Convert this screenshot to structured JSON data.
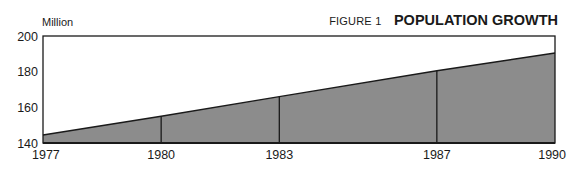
{
  "header": {
    "unit_label": "Million",
    "figure_label": "FIGURE 1",
    "title": "POPULATION GROWTH"
  },
  "colors": {
    "fill": "#8c8c8c",
    "line": "#1a1a1a",
    "background": "#ffffff"
  },
  "chart_data": {
    "type": "area",
    "title": "POPULATION GROWTH",
    "subtitle": "FIGURE 1",
    "xlabel": "",
    "ylabel": "Million",
    "x": [
      1977,
      1980,
      1983,
      1987,
      1990
    ],
    "values": [
      144.5,
      155,
      166,
      180.5,
      190.5
    ],
    "x_tick_labels": [
      "1977",
      "1980",
      "1983",
      "1987",
      "1990"
    ],
    "y_tick_labels": [
      "140",
      "160",
      "180",
      "200"
    ],
    "ylim": [
      140,
      200
    ],
    "xlim": [
      1977,
      1990
    ],
    "grid": false,
    "legend": null,
    "vertical_markers_at": [
      1980,
      1983,
      1987
    ]
  }
}
